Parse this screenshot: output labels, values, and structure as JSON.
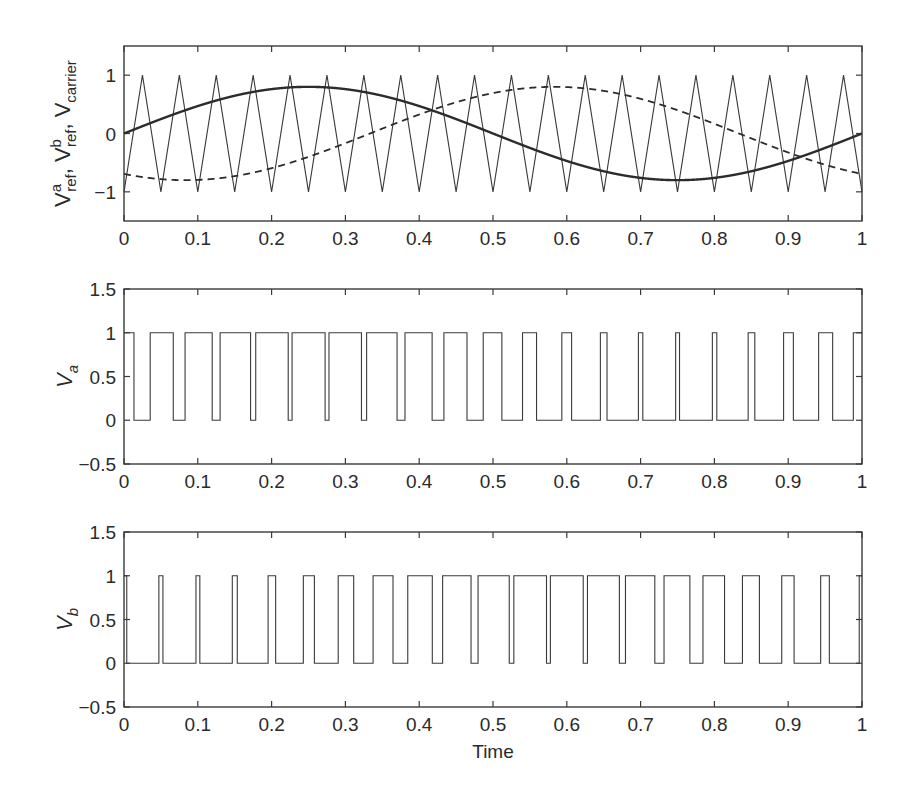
{
  "chart_data": [
    {
      "type": "line",
      "panel": "top",
      "title": "",
      "xlabel": "",
      "ylabel": "V_ref^a, V_ref^b, V_carrier",
      "ylabel_parts": {
        "v": "V",
        "a_sup": "a",
        "ref": "ref",
        "sep": ",",
        "b_sup": "b",
        "carrier": "carrier"
      },
      "xlim": [
        0,
        1
      ],
      "ylim": [
        -1.5,
        1.5
      ],
      "xticks": [
        "0",
        "0.1",
        "0.2",
        "0.3",
        "0.4",
        "0.5",
        "0.6",
        "0.7",
        "0.8",
        "0.9",
        "1"
      ],
      "yticks": [
        "−1",
        "0",
        "1"
      ],
      "ytick_values": [
        -1,
        0,
        1
      ],
      "series": [
        {
          "name": "V_ref^a",
          "style": "solid-thick",
          "formula": "0.8*sin(2*pi*t)",
          "amplitude": 0.8,
          "phase_deg": 0,
          "x": [
            0,
            0.1,
            0.2,
            0.25,
            0.3,
            0.4,
            0.5,
            0.6,
            0.7,
            0.75,
            0.8,
            0.9,
            1
          ],
          "values": [
            0,
            0.47,
            0.76,
            0.8,
            0.76,
            0.47,
            0,
            -0.47,
            -0.76,
            -0.8,
            -0.76,
            -0.47,
            0
          ]
        },
        {
          "name": "V_ref^b",
          "style": "dashed",
          "formula": "0.8*sin(2*pi*t - 2*pi/3)",
          "amplitude": 0.8,
          "phase_deg": -120,
          "x": [
            0,
            0.083,
            0.2,
            0.333,
            0.4,
            0.5,
            0.583,
            0.7,
            0.8,
            0.9,
            1
          ],
          "values": [
            -0.69,
            -0.8,
            -0.63,
            0,
            0.27,
            0.69,
            0.8,
            0.63,
            0.27,
            -0.27,
            -0.69
          ]
        },
        {
          "name": "V_carrier",
          "style": "solid-thin",
          "formula": "triangle, 20 cycles, -1 to 1",
          "frequency_cycles": 20,
          "min": -1,
          "max": 1,
          "x": [
            0,
            0.025,
            0.05,
            0.075,
            0.1
          ],
          "values": [
            -1,
            1,
            -1,
            1,
            -1
          ]
        }
      ]
    },
    {
      "type": "line",
      "panel": "middle",
      "ylabel": "V_a",
      "ylabel_parts": {
        "v": "V",
        "sub": "a"
      },
      "xlim": [
        0,
        1
      ],
      "ylim": [
        -0.5,
        1.5
      ],
      "xticks": [
        "0",
        "0.1",
        "0.2",
        "0.3",
        "0.4",
        "0.5",
        "0.6",
        "0.7",
        "0.8",
        "0.9",
        "1"
      ],
      "yticks": [
        "−0.5",
        "0",
        "0.5",
        "1",
        "1.5"
      ],
      "ytick_values": [
        -0.5,
        0,
        0.5,
        1,
        1.5
      ],
      "series": [
        {
          "name": "V_a",
          "style": "step",
          "rule": "1 if V_ref^a > V_carrier else 0",
          "ref_series": "V_ref^a"
        }
      ]
    },
    {
      "type": "line",
      "panel": "bottom",
      "ylabel": "V_b",
      "ylabel_parts": {
        "v": "V",
        "sub": "b"
      },
      "xlabel": "Time",
      "xlim": [
        0,
        1
      ],
      "ylim": [
        -0.5,
        1.5
      ],
      "xticks": [
        "0",
        "0.1",
        "0.2",
        "0.3",
        "0.4",
        "0.5",
        "0.6",
        "0.7",
        "0.8",
        "0.9",
        "1"
      ],
      "yticks": [
        "−0.5",
        "0",
        "0.5",
        "1",
        "1.5"
      ],
      "ytick_values": [
        -0.5,
        0,
        0.5,
        1,
        1.5
      ],
      "series": [
        {
          "name": "V_b",
          "style": "step",
          "rule": "1 if V_ref^b > V_carrier else 0",
          "ref_series": "V_ref^b"
        }
      ]
    }
  ],
  "colors": {
    "line": "#3a3a3a",
    "axis": "#3a3a3a",
    "text": "#2a2a2a",
    "background": "#ffffff"
  }
}
